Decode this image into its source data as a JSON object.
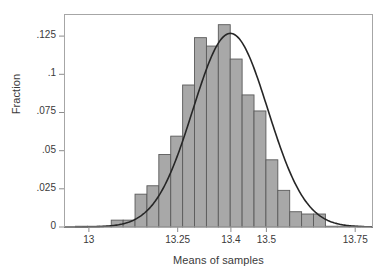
{
  "chart_data": {
    "type": "bar",
    "title": "",
    "subtitle": "",
    "xlabel": "Means of samples",
    "ylabel": "Fraction",
    "xlim": [
      12.93,
      13.8
    ],
    "ylim": [
      0,
      0.1395
    ],
    "grid": false,
    "legend": null,
    "annotations": [],
    "xticks": [
      13,
      13.25,
      13.4,
      13.5,
      13.75
    ],
    "xtick_labels": [
      "13",
      "13.25",
      "13.4",
      "13.5",
      "13.75"
    ],
    "yticks": [
      0,
      0.025,
      0.05,
      0.075,
      0.1,
      0.125
    ],
    "ytick_labels": [
      "0",
      ".025",
      ".05",
      ".075",
      ".1",
      ".125"
    ],
    "bin_width": 0.0335,
    "bin_starts": [
      12.9625,
      12.996,
      13.0295,
      13.063,
      13.0965,
      13.13,
      13.1635,
      13.197,
      13.2305,
      13.264,
      13.2975,
      13.331,
      13.3645,
      13.398,
      13.4315,
      13.465,
      13.4985,
      13.532,
      13.5655,
      13.599,
      13.6325,
      13.666,
      13.6995,
      13.733
    ],
    "categories": [
      "12.963",
      "12.996",
      "13.030",
      "13.063",
      "13.097",
      "13.130",
      "13.164",
      "13.197",
      "13.231",
      "13.264",
      "13.298",
      "13.331",
      "13.364",
      "13.398",
      "13.432",
      "13.465",
      "13.499",
      "13.532",
      "13.566",
      "13.599",
      "13.633",
      "13.666",
      "13.700",
      "13.733"
    ],
    "values": [
      0.0005,
      0.0005,
      0.0005,
      0.0045,
      0.0045,
      0.0215,
      0.027,
      0.0475,
      0.0595,
      0.093,
      0.124,
      0.1185,
      0.1325,
      0.11,
      0.0865,
      0.076,
      0.044,
      0.024,
      0.01,
      0.0085,
      0.0085,
      0.0005,
      0.0005,
      0.0005
    ],
    "bar_color": "#a8a8a8",
    "bar_edge_color": "#5a5a5a",
    "overlay_curve": {
      "name": "normal density",
      "type": "line",
      "color": "#262626",
      "mean": 13.3985,
      "sigma": 0.1055,
      "peak_value": 0.1268
    }
  },
  "axes": {
    "frame_color": "#a6a6a6",
    "tick_color": "#8c8c8c",
    "text_color": "#3a3a3a"
  }
}
